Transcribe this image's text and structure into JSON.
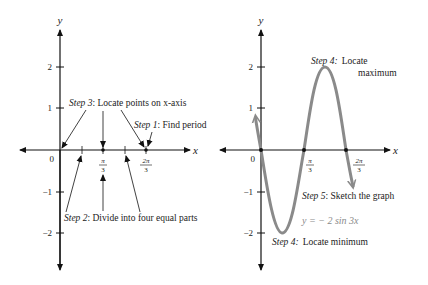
{
  "left_panel": {
    "y_axis_label": "y",
    "x_axis_label": "x",
    "origin_label": "0",
    "y_ticks": [
      "2",
      "1",
      "−1",
      "−2"
    ],
    "x_ticks": [
      {
        "num": "π",
        "den": "3"
      },
      {
        "num": "2π",
        "den": "3"
      }
    ],
    "step3": {
      "step": "Step 3",
      "text": ": Locate points on x-axis"
    },
    "step1": {
      "step": "Step 1",
      "text": ": Find period"
    },
    "step2": {
      "step": "Step 2",
      "text": ": Divide into four equal parts"
    }
  },
  "right_panel": {
    "y_axis_label": "y",
    "x_axis_label": "x",
    "origin_label": "0",
    "y_ticks": [
      "2",
      "1",
      "−1",
      "−2"
    ],
    "x_ticks": [
      {
        "num": "π",
        "den": "3"
      },
      {
        "num": "2π",
        "den": "3"
      }
    ],
    "step4_max": {
      "step": "Step 4:",
      "line1": "Locate",
      "line2": "maximum"
    },
    "step5": {
      "step": "Step 5",
      "text": ": Sketch the graph"
    },
    "equation": "y = − 2 sin 3x",
    "step4_min": {
      "step": "Step 4:",
      "text": "Locate minimum"
    },
    "curve_color": "#8a8a8a"
  }
}
